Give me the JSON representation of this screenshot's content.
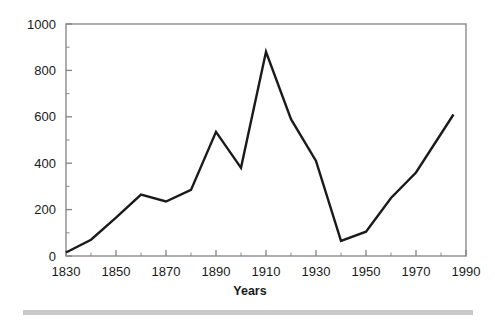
{
  "chart_data": {
    "type": "line",
    "title": "",
    "xlabel": "Years",
    "ylabel": "",
    "xlim": [
      1830,
      1990
    ],
    "ylim": [
      0,
      1000
    ],
    "grid": false,
    "legend": false,
    "x": [
      1830,
      1840,
      1850,
      1860,
      1870,
      1880,
      1890,
      1900,
      1910,
      1920,
      1930,
      1940,
      1950,
      1960,
      1970,
      1985
    ],
    "values": [
      15,
      70,
      165,
      265,
      235,
      285,
      535,
      380,
      880,
      590,
      410,
      65,
      105,
      250,
      360,
      610
    ],
    "series": [
      {
        "name": "series-1",
        "color": "#1a1a1a",
        "values": [
          15,
          70,
          165,
          265,
          235,
          285,
          535,
          380,
          880,
          590,
          410,
          65,
          105,
          250,
          360,
          610
        ]
      }
    ],
    "x_tick_labels": [
      "1830",
      "1850",
      "1870",
      "1890",
      "1910",
      "1930",
      "1950",
      "1970",
      "1990"
    ],
    "x_tick_values": [
      1830,
      1850,
      1870,
      1890,
      1910,
      1930,
      1950,
      1970,
      1990
    ],
    "x_minor_step": 10,
    "y_tick_labels": [
      "0",
      "200",
      "400",
      "600",
      "800",
      "1000"
    ],
    "y_tick_values": [
      0,
      200,
      400,
      600,
      800,
      1000
    ],
    "y_minor_step": 100,
    "axis_color": "#8a8a8a",
    "line_color": "#1a1a1a",
    "background_color": "#ffffff"
  },
  "figure": {
    "footer_rule_color": "#c9c9c9"
  }
}
